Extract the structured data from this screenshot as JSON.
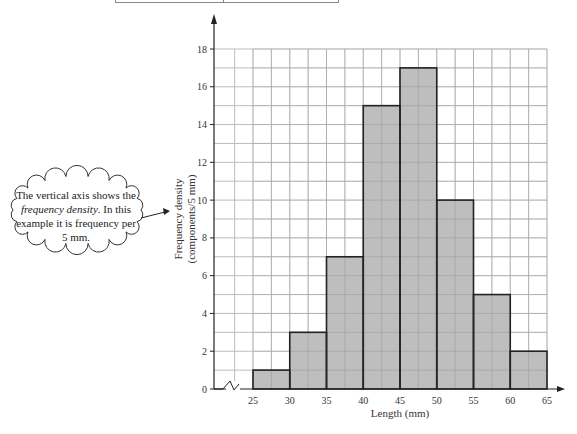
{
  "chart_data": {
    "type": "bar",
    "subtype": "histogram",
    "title": "",
    "xlabel": "Length (mm)",
    "ylabel": "Frequency density (components/5 mm)",
    "ylabel_line1": "Frequency density",
    "ylabel_line2": "(components/5 mm)",
    "bins": [
      [
        25,
        30
      ],
      [
        30,
        35
      ],
      [
        35,
        40
      ],
      [
        40,
        45
      ],
      [
        45,
        50
      ],
      [
        50,
        55
      ],
      [
        55,
        60
      ],
      [
        60,
        65
      ]
    ],
    "categories": [
      "25-30",
      "30-35",
      "35-40",
      "40-45",
      "45-50",
      "50-55",
      "55-60",
      "60-65"
    ],
    "values": [
      1,
      3,
      7,
      15,
      17,
      10,
      5,
      2
    ],
    "x_ticks": [
      "25",
      "30",
      "35",
      "40",
      "45",
      "50",
      "55",
      "60",
      "65"
    ],
    "y_ticks": [
      "0",
      "2",
      "4",
      "6",
      "8",
      "10",
      "12",
      "14",
      "16",
      "18"
    ],
    "xlim": [
      22.5,
      65
    ],
    "ylim": [
      0,
      18
    ],
    "grid": true,
    "axis_break": "zigzag on x-axis between origin and 25",
    "bar_color": "#b3b3b3",
    "grid_color": "#bdbdbd"
  },
  "annotation": {
    "text_before": "The vertical axis shows the ",
    "text_italic": "frequency density",
    "text_after": ". In this example it is frequency per 5 mm."
  }
}
